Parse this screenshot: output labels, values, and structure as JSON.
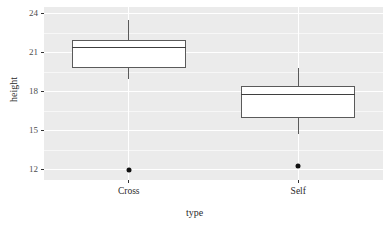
{
  "chart_data": {
    "type": "box",
    "title": "",
    "xlabel": "type",
    "ylabel": "height",
    "categories": [
      "Cross",
      "Self"
    ],
    "ylim": [
      11.2,
      24.5
    ],
    "y_ticks": [
      12,
      15,
      18,
      21,
      24
    ],
    "y_tick_labels": [
      "12",
      "15",
      "18",
      "21",
      "24"
    ],
    "grid": true,
    "grid_color": "#ffffff",
    "panel_background": "#ebebeb",
    "legend": "none",
    "boxes": [
      {
        "category": "Cross",
        "whisker_low": 19.0,
        "q1": 19.8,
        "median": 21.4,
        "q3": 22.0,
        "whisker_high": 23.5,
        "outliers": [
          12.0
        ]
      },
      {
        "category": "Self",
        "whisker_low": 14.7,
        "q1": 16.0,
        "median": 17.8,
        "q3": 18.4,
        "whisker_high": 19.8,
        "outliers": [
          12.3
        ]
      }
    ]
  },
  "axes": {
    "y_title": "height",
    "x_title": "type",
    "y_tick_labels": [
      "24",
      "21",
      "18",
      "15",
      "12"
    ],
    "x_tick_labels": [
      "Cross",
      "Self"
    ]
  },
  "colors": {
    "panel": "#ebebeb",
    "grid": "#ffffff",
    "box_stroke": "#5a5a5a",
    "box_fill": "#ffffff",
    "outlier": "#111111",
    "text": "#2b2b2b"
  }
}
